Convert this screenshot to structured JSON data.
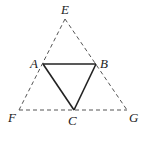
{
  "diagram": {
    "points": {
      "E": {
        "label": "E",
        "x": 65,
        "y": 19,
        "lx": 66,
        "ly": 14
      },
      "A": {
        "label": "A",
        "x": 43,
        "y": 64,
        "lx": 35,
        "ly": 68
      },
      "B": {
        "label": "B",
        "x": 96,
        "y": 64,
        "lx": 104,
        "ly": 68
      },
      "F": {
        "label": "F",
        "x": 19,
        "y": 110,
        "lx": 13,
        "ly": 122
      },
      "C": {
        "label": "C",
        "x": 74,
        "y": 110,
        "lx": 73,
        "ly": 124
      },
      "G": {
        "label": "G",
        "x": 127,
        "y": 110,
        "lx": 134,
        "ly": 122
      }
    },
    "outer_triangle": {
      "vertices": [
        "E",
        "F",
        "G"
      ],
      "style": "dashed",
      "color": "#555555"
    },
    "inner_triangle": {
      "vertices": [
        "A",
        "B",
        "C"
      ],
      "style": "solid",
      "color": "#222222"
    }
  }
}
